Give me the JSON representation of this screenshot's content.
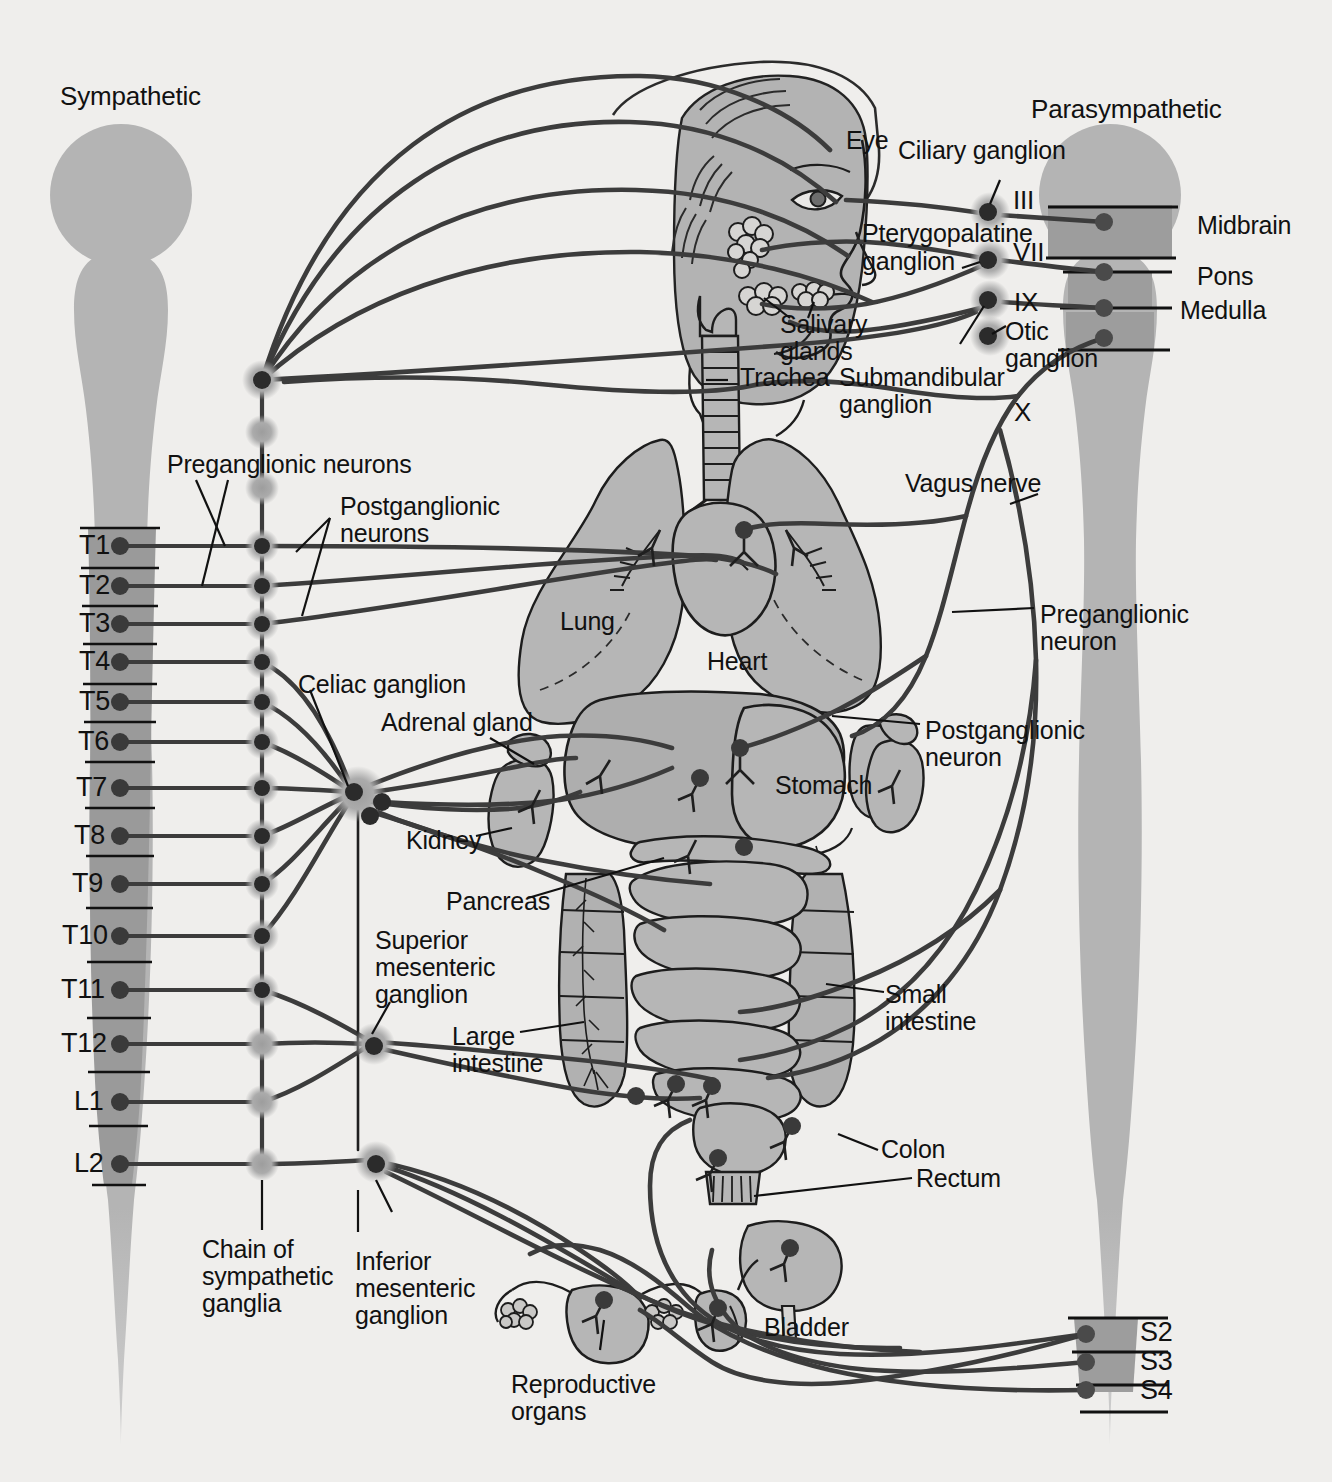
{
  "diagram": {
    "title_left": "Sympathetic",
    "title_right": "Parasympathetic",
    "colors": {
      "background": "#efeeec",
      "cord_gray": "#b3b3b3",
      "cord_dark": "#9a9a9a",
      "organ_gray": "#b6b6b6",
      "nerve_dark": "#3c3c3c",
      "outline": "#1a1a1a",
      "ganglion_halo": "#a8a8a8"
    }
  },
  "brainstem_labels": [
    {
      "text": "Midbrain"
    },
    {
      "text": "Pons"
    },
    {
      "text": "Medulla"
    }
  ],
  "cranial_nerves": [
    {
      "text": "III"
    },
    {
      "text": "VII"
    },
    {
      "text": "IX"
    },
    {
      "text": "X"
    }
  ],
  "head_labels": [
    {
      "text": "Eye"
    },
    {
      "text": "Ciliary ganglion"
    },
    {
      "text": "Pterygopalatine"
    },
    {
      "text": "ganglion"
    },
    {
      "text": "Salivary"
    },
    {
      "text": "glands"
    },
    {
      "text": "Trachea"
    },
    {
      "text": "Submandibular"
    },
    {
      "text": "ganglion"
    },
    {
      "text": "Otic"
    },
    {
      "text": "ganglion"
    }
  ],
  "neuron_labels": {
    "pre_plural": "Preganglionic neurons",
    "post_plural_l1": "Postganglionic",
    "post_plural_l2": "neurons",
    "pre_single_l1": "Preganglionic",
    "pre_single_l2": "neuron",
    "post_single_l1": "Postganglionic",
    "post_single_l2": "neuron",
    "vagus": "Vagus nerve"
  },
  "ganglion_labels": {
    "celiac": "Celiac ganglion",
    "superior_mesenteric_l1": "Superior",
    "superior_mesenteric_l2": "mesenteric",
    "superior_mesenteric_l3": "ganglion",
    "inferior_mesenteric_l1": "Inferior",
    "inferior_mesenteric_l2": "mesenteric",
    "inferior_mesenteric_l3": "ganglion",
    "chain_l1": "Chain of",
    "chain_l2": "sympathetic",
    "chain_l3": "ganglia"
  },
  "organ_labels": [
    {
      "text": "Lung"
    },
    {
      "text": "Heart"
    },
    {
      "text": "Stomach"
    },
    {
      "text": "Adrenal gland"
    },
    {
      "text": "Kidney"
    },
    {
      "text": "Pancreas"
    },
    {
      "text": "Large"
    },
    {
      "text": "intestine"
    },
    {
      "text": "Small"
    },
    {
      "text": "intestine"
    },
    {
      "text": "Colon"
    },
    {
      "text": "Rectum"
    },
    {
      "text": "Bladder"
    },
    {
      "text": "Reproductive"
    },
    {
      "text": "organs"
    }
  ],
  "spinal_segments_thoracolumbar": [
    {
      "label": "T1"
    },
    {
      "label": "T2"
    },
    {
      "label": "T3"
    },
    {
      "label": "T4"
    },
    {
      "label": "T5"
    },
    {
      "label": "T6"
    },
    {
      "label": "T7"
    },
    {
      "label": "T8"
    },
    {
      "label": "T9"
    },
    {
      "label": "T10"
    },
    {
      "label": "T11"
    },
    {
      "label": "T12"
    },
    {
      "label": "L1"
    },
    {
      "label": "L2"
    }
  ],
  "spinal_segments_sacral": [
    {
      "label": "S2"
    },
    {
      "label": "S3"
    },
    {
      "label": "S4"
    }
  ]
}
